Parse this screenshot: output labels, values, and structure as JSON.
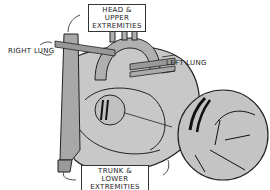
{
  "diagram": {
    "labels": {
      "head_upper_line1": "HEAD & UPPER",
      "head_upper_line2": "EXTREMITIES",
      "right_lung": "RIGHT LUNG",
      "left_lung": "LEFT LUNG",
      "trunk_lower_line1": "TRUNK & LOWER",
      "trunk_lower_line2": "EXTREMITIES"
    },
    "colors": {
      "vessel_fill": "#b8b8b8",
      "vessel_dark": "#8a8a8a",
      "line": "#222222",
      "background": "#ffffff"
    }
  }
}
